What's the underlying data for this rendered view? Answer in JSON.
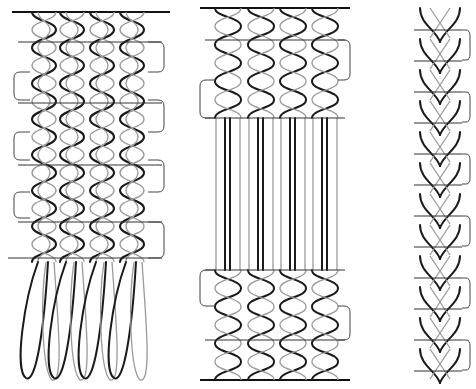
{
  "diagram": {
    "panels": [
      {
        "id": "panel-left",
        "name": "interlinked warp with open loops at bottom",
        "columns": 4,
        "shed_rows": 5
      },
      {
        "id": "panel-middle",
        "name": "interlinked warp with straight parallel section in middle",
        "columns": 4
      },
      {
        "id": "panel-right",
        "name": "narrow braid with chevron interlacing",
        "columns": 1
      }
    ],
    "colors": {
      "dark_strand": "#1a1a1a",
      "light_strand": "#9a9a9a",
      "background": "#ffffff"
    }
  }
}
